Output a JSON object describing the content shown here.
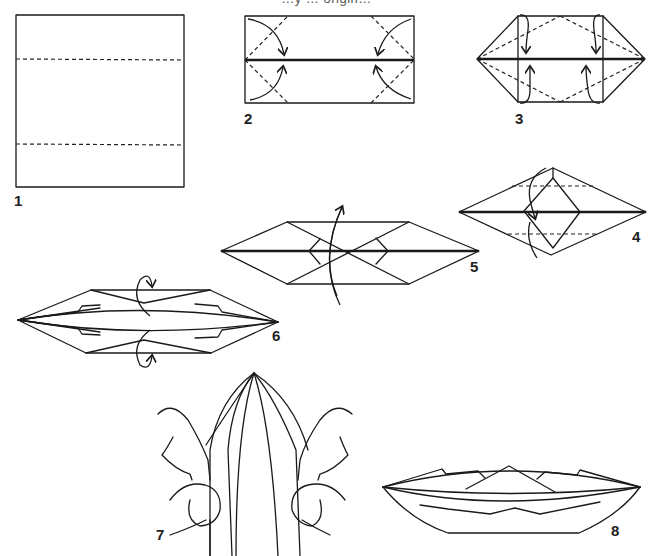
{
  "caption": "…y … origin…",
  "diagram": {
    "step_labels": [
      "1",
      "2",
      "3",
      "4",
      "5",
      "6",
      "7",
      "8"
    ],
    "steps": [
      {
        "n": "1",
        "desc": "Square with two horizontal valley fold lines"
      },
      {
        "n": "2",
        "desc": "Rectangle folded to center; corners folded in"
      },
      {
        "n": "3",
        "desc": "Hexagon; fold flaps with arrows"
      },
      {
        "n": "4",
        "desc": "Diamond shape with inner square; fold down"
      },
      {
        "n": "5",
        "desc": "Elongated hexagon; turn over"
      },
      {
        "n": "6",
        "desc": "Long boat shape; fold edges over"
      },
      {
        "n": "7",
        "desc": "Hands opening the boat"
      },
      {
        "n": "8",
        "desc": "Finished boat"
      }
    ]
  },
  "colors": {
    "ink": "#1a1a1a",
    "paper": "#ffffff"
  }
}
